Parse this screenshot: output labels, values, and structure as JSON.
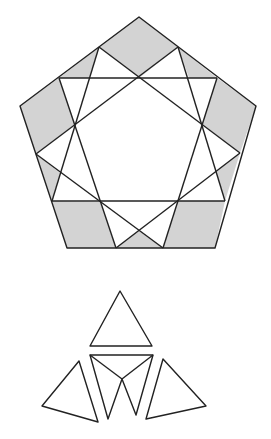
{
  "diagram": {
    "colors": {
      "stroke": "#222222",
      "shade": "#d3d3d3",
      "background": "#ffffff"
    },
    "stroke_width": 1.4,
    "pentagon": {
      "outline": [
        [
          139,
          17
        ],
        [
          256,
          106
        ],
        [
          215,
          248
        ],
        [
          67,
          248
        ],
        [
          20,
          106
        ]
      ],
      "lines": [
        [
          [
            99,
            47
          ],
          [
            52,
            201
          ]
        ],
        [
          [
            178,
            47
          ],
          [
            225,
            201
          ]
        ],
        [
          [
            178,
            47
          ],
          [
            36,
            154
          ]
        ],
        [
          [
            99,
            47
          ],
          [
            240,
            153
          ]
        ],
        [
          [
            59,
            78
          ],
          [
            217,
            78
          ]
        ],
        [
          [
            36,
            154
          ],
          [
            163,
            248
          ]
        ],
        [
          [
            240,
            153
          ],
          [
            116,
            248
          ]
        ],
        [
          [
            52,
            201
          ],
          [
            225,
            201
          ]
        ],
        [
          [
            59,
            78
          ],
          [
            116,
            248
          ]
        ],
        [
          [
            217,
            78
          ],
          [
            163,
            248
          ]
        ]
      ],
      "shaded_regions": [
        [
          [
            139,
            17
          ],
          [
            178,
            47
          ],
          [
            139,
            78
          ],
          [
            99,
            47
          ]
        ],
        [
          [
            99,
            47
          ],
          [
            59,
            78
          ],
          [
            89,
            78
          ]
        ],
        [
          [
            178,
            47
          ],
          [
            217,
            78
          ],
          [
            189,
            78
          ]
        ],
        [
          [
            256,
            106
          ],
          [
            240,
            153
          ],
          [
            202,
            124
          ],
          [
            217,
            78
          ]
        ],
        [
          [
            240,
            153
          ],
          [
            225,
            201
          ],
          [
            216,
            171
          ]
        ],
        [
          [
            20,
            106
          ],
          [
            59,
            78
          ],
          [
            75,
            124
          ],
          [
            36,
            154
          ]
        ],
        [
          [
            36,
            154
          ],
          [
            52,
            201
          ],
          [
            60,
            173
          ]
        ],
        [
          [
            67,
            248
          ],
          [
            52,
            201
          ],
          [
            100,
            202
          ],
          [
            116,
            248
          ]
        ],
        [
          [
            215,
            248
          ],
          [
            163,
            248
          ],
          [
            178,
            201
          ],
          [
            225,
            201
          ]
        ],
        [
          [
            116,
            248
          ],
          [
            163,
            248
          ],
          [
            139,
            230
          ]
        ]
      ]
    },
    "pieces": {
      "top_triangle": [
        [
          120,
          291
        ],
        [
          90,
          346
        ],
        [
          152,
          346
        ]
      ],
      "middle_w": {
        "outline": [
          [
            90,
            355
          ],
          [
            153,
            355
          ],
          [
            136,
            415
          ],
          [
            122,
            379
          ],
          [
            108,
            419
          ]
        ],
        "inner_lines": [
          [
            [
              90,
              355
            ],
            [
              122,
              379
            ]
          ],
          [
            [
              153,
              355
            ],
            [
              122,
              379
            ]
          ]
        ]
      },
      "left_triangle": [
        [
          79,
          361
        ],
        [
          42,
          406
        ],
        [
          98,
          422
        ]
      ],
      "right_triangle": [
        [
          163,
          359
        ],
        [
          206,
          406
        ],
        [
          146,
          419
        ]
      ]
    }
  }
}
